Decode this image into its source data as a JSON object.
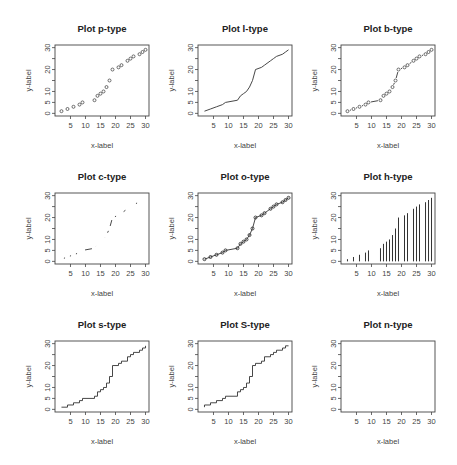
{
  "figure": {
    "layout": "3x3 grid of R base-graphics plots",
    "panels": [
      {
        "title": "Plot p-type",
        "type": "p"
      },
      {
        "title": "Plot l-type",
        "type": "l"
      },
      {
        "title": "Plot b-type",
        "type": "b"
      },
      {
        "title": "Plot c-type",
        "type": "c"
      },
      {
        "title": "Plot o-type",
        "type": "o"
      },
      {
        "title": "Plot h-type",
        "type": "h"
      },
      {
        "title": "Plot s-type",
        "type": "s"
      },
      {
        "title": "Plot S-type",
        "type": "S"
      },
      {
        "title": "Plot n-type",
        "type": "n"
      }
    ],
    "xlabel": "x-label",
    "ylabel": "y-label",
    "xticks": [
      5,
      10,
      15,
      20,
      25,
      30
    ],
    "yticks": [
      0,
      5,
      10,
      20,
      30
    ],
    "yminor_ticks": [
      0,
      5,
      10,
      15,
      20,
      25,
      30
    ],
    "colors": {
      "line": "#333333",
      "axis": "#444444",
      "text": "#333333",
      "background": "#ffffff"
    }
  },
  "chart_data": [
    {
      "type": "scatter",
      "title": "Plot p-type",
      "xlabel": "x-label",
      "ylabel": "y-label",
      "xlim": [
        1,
        30
      ],
      "ylim": [
        0,
        30
      ],
      "grid": false,
      "series": [
        {
          "name": "p",
          "x": [
            2,
            4,
            6,
            8,
            9,
            13,
            14,
            15,
            16,
            17,
            18,
            19,
            21,
            22,
            24,
            25,
            26,
            28,
            29,
            30
          ],
          "y": [
            1,
            2,
            3,
            4,
            5,
            6,
            8,
            9,
            10,
            12,
            15,
            20,
            21,
            22,
            24,
            25,
            26,
            27,
            28,
            29
          ]
        }
      ]
    },
    {
      "type": "line",
      "title": "Plot l-type",
      "xlabel": "x-label",
      "ylabel": "y-label",
      "xlim": [
        1,
        30
      ],
      "ylim": [
        0,
        30
      ],
      "grid": false,
      "series": [
        {
          "name": "l",
          "x": [
            2,
            4,
            6,
            8,
            9,
            13,
            14,
            15,
            16,
            17,
            18,
            19,
            21,
            22,
            24,
            25,
            26,
            28,
            29,
            30
          ],
          "y": [
            1,
            2,
            3,
            4,
            5,
            6,
            8,
            9,
            10,
            12,
            15,
            20,
            21,
            22,
            24,
            25,
            26,
            27,
            28,
            29
          ]
        }
      ]
    },
    {
      "type": "line",
      "title": "Plot b-type",
      "xlabel": "x-label",
      "ylabel": "y-label",
      "xlim": [
        1,
        30
      ],
      "ylim": [
        0,
        30
      ],
      "grid": false,
      "series": [
        {
          "name": "b",
          "x": [
            2,
            4,
            6,
            8,
            9,
            13,
            14,
            15,
            16,
            17,
            18,
            19,
            21,
            22,
            24,
            25,
            26,
            28,
            29,
            30
          ],
          "y": [
            1,
            2,
            3,
            4,
            5,
            6,
            8,
            9,
            10,
            12,
            15,
            20,
            21,
            22,
            24,
            25,
            26,
            27,
            28,
            29
          ]
        }
      ]
    },
    {
      "type": "line",
      "title": "Plot c-type",
      "xlabel": "x-label",
      "ylabel": "y-label",
      "xlim": [
        1,
        30
      ],
      "ylim": [
        0,
        30
      ],
      "grid": false,
      "series": [
        {
          "name": "c",
          "x": [
            2,
            4,
            6,
            8,
            9,
            13,
            14,
            15,
            16,
            17,
            18,
            19,
            21,
            22,
            24,
            25,
            26,
            28,
            29,
            30
          ],
          "y": [
            1,
            2,
            3,
            4,
            5,
            6,
            8,
            9,
            10,
            12,
            15,
            20,
            21,
            22,
            24,
            25,
            26,
            27,
            28,
            29
          ]
        }
      ]
    },
    {
      "type": "line",
      "title": "Plot o-type",
      "xlabel": "x-label",
      "ylabel": "y-label",
      "xlim": [
        1,
        30
      ],
      "ylim": [
        0,
        30
      ],
      "grid": false,
      "series": [
        {
          "name": "o",
          "x": [
            2,
            4,
            6,
            8,
            9,
            13,
            14,
            15,
            16,
            17,
            18,
            19,
            21,
            22,
            24,
            25,
            26,
            28,
            29,
            30
          ],
          "y": [
            1,
            2,
            3,
            4,
            5,
            6,
            8,
            9,
            10,
            12,
            15,
            20,
            21,
            22,
            24,
            25,
            26,
            27,
            28,
            29
          ]
        }
      ]
    },
    {
      "type": "bar",
      "title": "Plot h-type",
      "xlabel": "x-label",
      "ylabel": "y-label",
      "xlim": [
        1,
        30
      ],
      "ylim": [
        0,
        30
      ],
      "grid": false,
      "series": [
        {
          "name": "h",
          "x": [
            2,
            4,
            6,
            8,
            9,
            13,
            14,
            15,
            16,
            17,
            18,
            19,
            21,
            22,
            24,
            25,
            26,
            28,
            29,
            30
          ],
          "y": [
            1,
            2,
            3,
            4,
            5,
            6,
            8,
            9,
            10,
            12,
            15,
            20,
            21,
            22,
            24,
            25,
            26,
            27,
            28,
            29
          ]
        }
      ]
    },
    {
      "type": "line",
      "title": "Plot s-type",
      "xlabel": "x-label",
      "ylabel": "y-label",
      "xlim": [
        1,
        30
      ],
      "ylim": [
        0,
        30
      ],
      "grid": false,
      "series": [
        {
          "name": "s",
          "x": [
            2,
            4,
            6,
            8,
            9,
            13,
            14,
            15,
            16,
            17,
            18,
            19,
            21,
            22,
            24,
            25,
            26,
            28,
            29,
            30
          ],
          "y": [
            1,
            2,
            3,
            4,
            5,
            6,
            8,
            9,
            10,
            12,
            15,
            20,
            21,
            22,
            24,
            25,
            26,
            27,
            28,
            29
          ]
        }
      ]
    },
    {
      "type": "line",
      "title": "Plot S-type",
      "xlabel": "x-label",
      "ylabel": "y-label",
      "xlim": [
        1,
        30
      ],
      "ylim": [
        0,
        30
      ],
      "grid": false,
      "series": [
        {
          "name": "S",
          "x": [
            2,
            4,
            6,
            8,
            9,
            13,
            14,
            15,
            16,
            17,
            18,
            19,
            21,
            22,
            24,
            25,
            26,
            28,
            29,
            30
          ],
          "y": [
            1,
            2,
            3,
            4,
            5,
            6,
            8,
            9,
            10,
            12,
            15,
            20,
            21,
            22,
            24,
            25,
            26,
            27,
            28,
            29
          ]
        }
      ]
    },
    {
      "type": "line",
      "title": "Plot n-type",
      "xlabel": "x-label",
      "ylabel": "y-label",
      "xlim": [
        1,
        30
      ],
      "ylim": [
        0,
        30
      ],
      "grid": false,
      "series": []
    }
  ]
}
